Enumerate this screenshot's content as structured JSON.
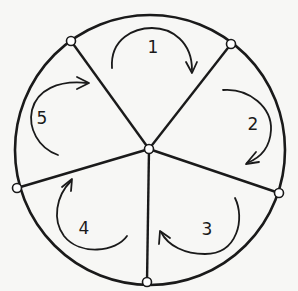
{
  "diagram": {
    "type": "wheel-graph",
    "colors": {
      "background": "#f7f7f5",
      "stroke": "#1a1a1a",
      "node_fill": "#ffffff"
    },
    "circle": {
      "cx": 150,
      "cy": 150,
      "r": 135
    },
    "hub": {
      "id": "center",
      "x": 149,
      "y": 149
    },
    "rim_nodes": [
      {
        "id": "n-top-left",
        "x": 71,
        "y": 41
      },
      {
        "id": "n-top-right",
        "x": 231,
        "y": 44
      },
      {
        "id": "n-right",
        "x": 279,
        "y": 193
      },
      {
        "id": "n-bottom",
        "x": 147,
        "y": 282
      },
      {
        "id": "n-left",
        "x": 17,
        "y": 188
      }
    ],
    "regions": [
      {
        "label": "1",
        "label_x": 153,
        "label_y": 53,
        "arrow": "M112,68 C110,38 135,28 152,28 C172,28 192,42 192,70",
        "head": "M186,62 L192,73 L197,62",
        "direction": "clockwise"
      },
      {
        "label": "2",
        "label_x": 253,
        "label_y": 130,
        "arrow": "M223,90 C250,88 272,108 271,130 C270,148 260,158 247,163",
        "head": "M256,152 L246,164 L259,162",
        "direction": "clockwise"
      },
      {
        "label": "3",
        "label_x": 207,
        "label_y": 235,
        "arrow": "M235,198 C245,218 238,254 205,254 C185,254 168,246 161,232",
        "head": "M159,244 L160,231 L170,238",
        "direction": "clockwise"
      },
      {
        "label": "4",
        "label_x": 84,
        "label_y": 234,
        "arrow": "M127,236 C116,252 80,256 64,236 C52,220 56,196 71,181",
        "head": "M62,187 L72,179 L71,191",
        "direction": "clockwise"
      },
      {
        "label": "5",
        "label_x": 42,
        "label_y": 124,
        "arrow": "M58,155 C38,148 28,128 32,110 C37,90 58,80 87,83",
        "head": "M77,77 L89,83 L77,89",
        "direction": "clockwise"
      }
    ]
  }
}
